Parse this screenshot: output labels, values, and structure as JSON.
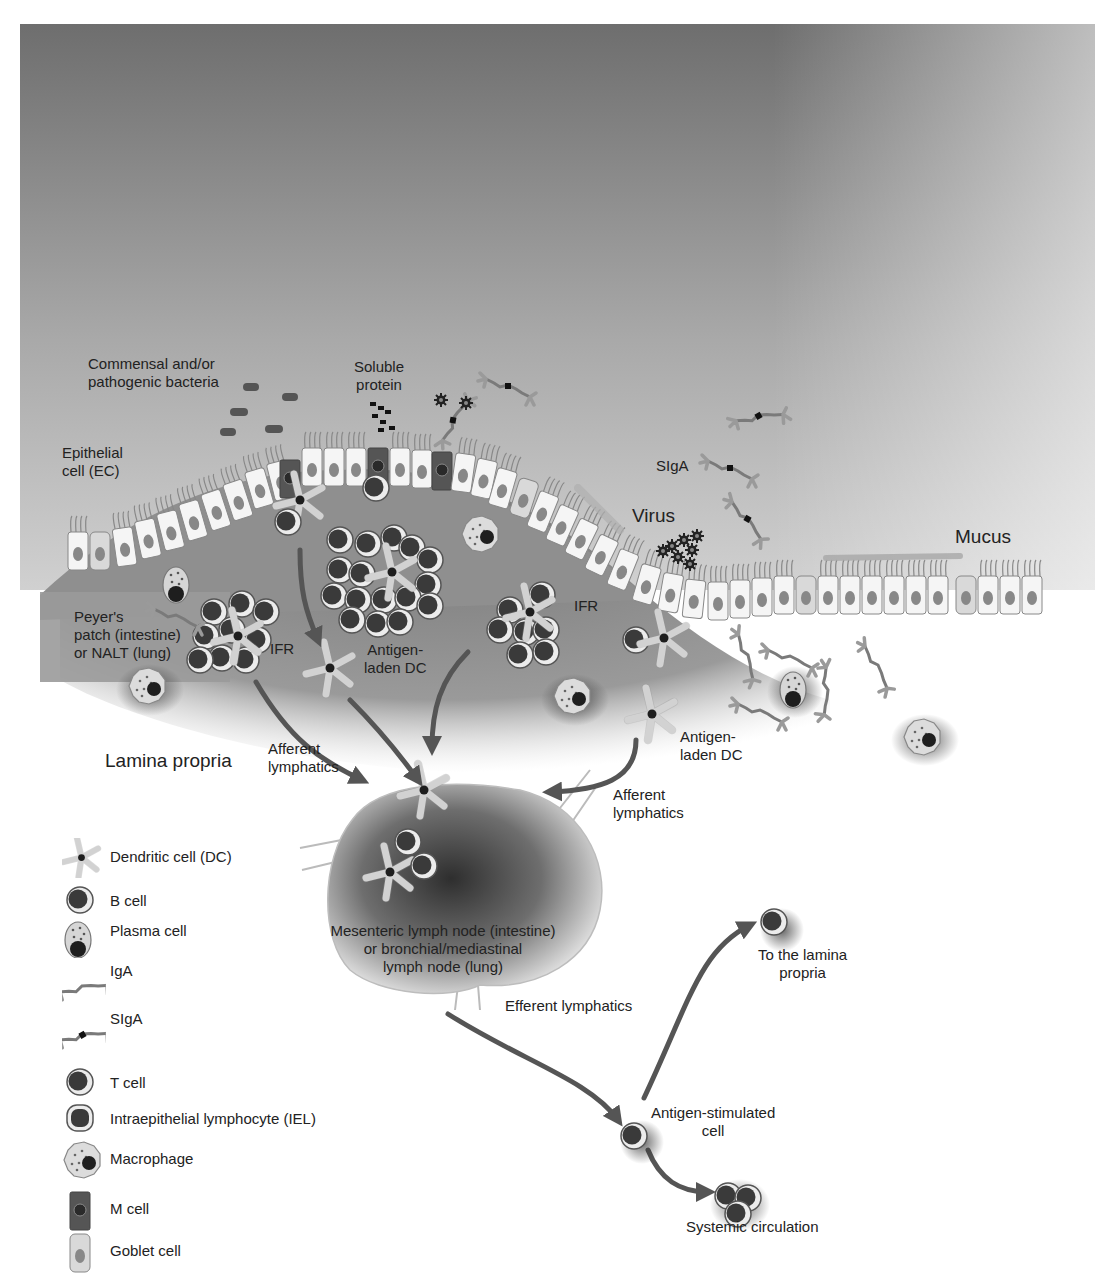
{
  "figure": {
    "background_gradient": {
      "top": "#6f6f6f",
      "bottom": "#c9c9c9"
    },
    "colors": {
      "tissue": "#8c8c8c",
      "epithelial_cell": "#f4f4f4",
      "nucleus": "#8a8a8a",
      "lymphocyte_core": "#3a3a3a",
      "arrow": "#555555",
      "lymph_node_edge": "#bdbdbd"
    }
  },
  "labels": {
    "bacteria": [
      "Commensal and/or",
      "pathogenic bacteria"
    ],
    "soluble_protein": [
      "Soluble",
      "protein"
    ],
    "epithelial_cell": [
      "Epithelial",
      "cell (EC)"
    ],
    "sIgA": "SIgA",
    "virus": "Virus",
    "mucus": "Mucus",
    "peyers_patch": [
      "Peyer's",
      "patch (intestine)",
      "or NALT (lung)"
    ],
    "ifr_left": "IFR",
    "ifr_right": "IFR",
    "antigen_laden_dc_center": [
      "Antigen-",
      "laden DC"
    ],
    "antigen_laden_dc_right": [
      "Antigen-",
      "laden DC"
    ],
    "lamina_propria": "Lamina propria",
    "afferent_left": [
      "Afferent",
      "lymphatics"
    ],
    "afferent_right": [
      "Afferent",
      "lymphatics"
    ],
    "lymph_node": [
      "Mesenteric lymph node (intestine)",
      "or bronchial/mediastinal",
      "lymph node (lung)"
    ],
    "efferent": "Efferent lymphatics",
    "to_lamina_propria": [
      "To the lamina",
      "propria"
    ],
    "antigen_stimulated": [
      "Antigen-stimulated",
      "cell"
    ],
    "systemic": "Systemic circulation"
  },
  "legend": {
    "items": [
      {
        "icon": "dendritic-cell-icon",
        "label": "Dendritic cell (DC)"
      },
      {
        "icon": "b-cell-icon",
        "label": "B cell"
      },
      {
        "icon": "plasma-cell-icon",
        "label": "Plasma cell"
      },
      {
        "icon": "iga-icon",
        "label": "IgA"
      },
      {
        "icon": "siga-icon",
        "label": "SIgA"
      },
      {
        "icon": "t-cell-icon",
        "label": "T cell"
      },
      {
        "icon": "iel-icon",
        "label": "Intraepithelial lymphocyte (IEL)"
      },
      {
        "icon": "macrophage-icon",
        "label": "Macrophage"
      },
      {
        "icon": "m-cell-icon",
        "label": "M cell"
      },
      {
        "icon": "goblet-cell-icon",
        "label": "Goblet cell"
      }
    ]
  }
}
